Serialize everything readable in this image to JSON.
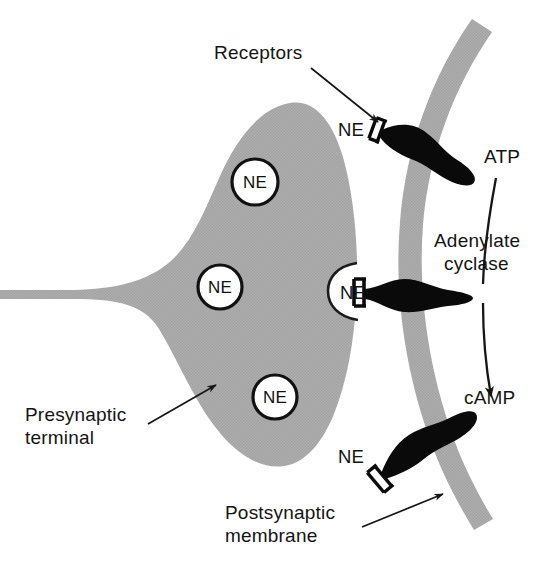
{
  "figure": {
    "background_color": "#ffffff",
    "width": 547,
    "height": 569
  },
  "colors": {
    "cytoplasm_gray": "#ababab",
    "membrane_gray": "#b0b0b0",
    "receptor_black": "#0a0a0a",
    "text_black": "#141414",
    "vesicle_fill": "#ffffff",
    "vesicle_stroke": "#111111"
  },
  "labels": {
    "receptors": "Receptors",
    "presynaptic_terminal": "Presynaptic\nterminal",
    "postsynaptic_membrane": "Postsynaptic\nmembrane",
    "atp": "ATP",
    "adenylate_cyclase": "Adenylate\ncyclase",
    "camp": "cAMP",
    "presynaptic_terminal_line1": "Presynaptic",
    "presynaptic_terminal_line2": "terminal",
    "postsynaptic_membrane_line1": "Postsynaptic",
    "postsynaptic_membrane_line2": "membrane",
    "adenylate_cyclase_line1": "Adenylate",
    "adenylate_cyclase_line2": "cyclase"
  },
  "vesicles": [
    {
      "id": "vesicle-top",
      "label": "NE",
      "cx": 255,
      "cy": 182,
      "r": 23
    },
    {
      "id": "vesicle-middle",
      "label": "NE",
      "cx": 220,
      "cy": 287,
      "r": 22
    },
    {
      "id": "vesicle-bottom",
      "label": "NE",
      "cx": 275,
      "cy": 397,
      "r": 22
    }
  ],
  "synaptic_ne": [
    {
      "id": "ne-cleft-top",
      "label": "NE",
      "x": 338,
      "y": 137
    },
    {
      "id": "ne-cleft-middle",
      "label": "NE",
      "x": 340,
      "y": 300
    },
    {
      "id": "ne-cleft-bottom",
      "label": "NE",
      "x": 338,
      "y": 464
    }
  ],
  "receptors": [
    {
      "id": "receptor-top",
      "bound_ligand": "NE",
      "angle_deg": 22
    },
    {
      "id": "receptor-middle",
      "bound_ligand": "NE",
      "angle_deg": 0
    },
    {
      "id": "receptor-bottom",
      "bound_ligand": "NE",
      "angle_deg": -38
    }
  ],
  "reaction": {
    "substrate": "ATP",
    "enzyme": "Adenylate cyclase",
    "product": "cAMP",
    "arrow": "curved-downward"
  },
  "callouts": [
    {
      "id": "callout-receptors",
      "label": "Receptors",
      "points_to": "receptor-top"
    },
    {
      "id": "callout-presynaptic",
      "label": "Presynaptic terminal",
      "points_to": "presynaptic-terminal"
    },
    {
      "id": "callout-postsynaptic",
      "label": "Postsynaptic membrane",
      "points_to": "postsynaptic-membrane"
    }
  ]
}
